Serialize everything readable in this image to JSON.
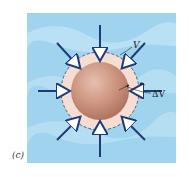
{
  "figure": {
    "panel_label": "(c)",
    "labels": {
      "volume": "V",
      "volume_change": "ΔV"
    },
    "colors": {
      "fluid_background": "#9fd3ee",
      "fluid_wave": "#c4e6f7",
      "ring": "#f6ddd3",
      "sphere": "#c98f7a",
      "arrow": "#1e3a78",
      "dashed_circle": "#444444"
    },
    "arrow_count": 8
  }
}
